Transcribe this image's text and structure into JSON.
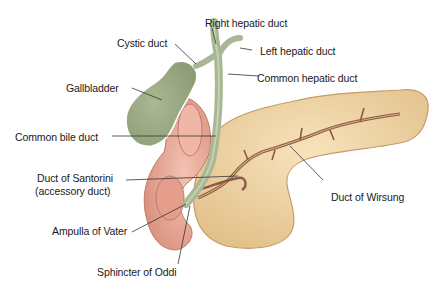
{
  "labels": {
    "right_hepatic_duct": "Right hepatic duct",
    "cystic_duct": "Cystic duct",
    "left_hepatic_duct": "Left hepatic duct",
    "common_hepatic_duct": "Common hepatic duct",
    "gallbladder": "Gallbladder",
    "common_bile_duct": "Common bile duct",
    "duct_of_santorini_line1": "Duct of Santorini",
    "duct_of_santorini_line2": "(accessory duct)",
    "duct_of_wirsung": "Duct of Wirsung",
    "ampulla_of_vater": "Ampulla of Vater",
    "sphincter_of_oddi": "Sphincter of Oddi"
  },
  "colors": {
    "gallbladder": "#9aa983",
    "duct": "#a9b894",
    "pancreas": "#ecd1a0",
    "pancreas_edge": "#c99a6a",
    "duodenum": "#e7a896",
    "duodenum_inner": "#d98b7a",
    "leader": "#333333",
    "text": "#1a1a1a"
  }
}
